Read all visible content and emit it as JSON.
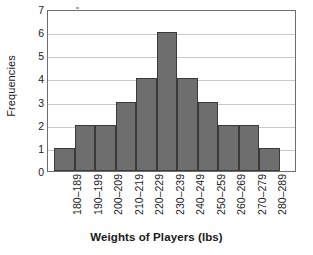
{
  "chart_data": {
    "type": "bar",
    "title": "",
    "xlabel": "Weights of Players (lbs)",
    "ylabel": "Frequencies",
    "categories": [
      "180–189",
      "190–199",
      "200–209",
      "210–219",
      "220–229",
      "230–239",
      "240–249",
      "250–259",
      "260–269",
      "270–279",
      "280–289"
    ],
    "values": [
      1,
      2,
      2,
      3,
      4,
      6,
      4,
      3,
      2,
      2,
      1
    ],
    "ylim": [
      0,
      7
    ],
    "ytick_labels": [
      "0",
      "1",
      "2",
      "3",
      "4",
      "5",
      "6",
      "7"
    ],
    "ytick_values": [
      0,
      1,
      2,
      3,
      4,
      5,
      6,
      7
    ],
    "grid": "horizontal",
    "legend": "none",
    "bar_color": "#6e6e6e",
    "bar_edge_color": "#3a3a3a",
    "gridline_color": "#c9c9cc",
    "axis_color": "#6d6d73",
    "background_color": "#ffffff"
  }
}
